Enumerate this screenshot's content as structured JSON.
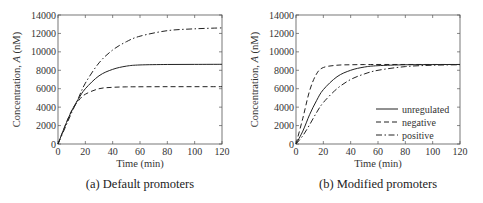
{
  "chart_data": [
    {
      "id": "a",
      "type": "line",
      "caption": "(a) Default promoters",
      "xlabel": "Time (min)",
      "ylabel": "Concentration, A (nM)",
      "xlim": [
        0,
        120
      ],
      "ylim": [
        0,
        14000
      ],
      "xticks": [
        0,
        20,
        40,
        60,
        80,
        100,
        120
      ],
      "yticks": [
        0,
        2000,
        4000,
        6000,
        8000,
        10000,
        12000,
        14000
      ],
      "grid": false,
      "legend": null,
      "x": [
        0,
        5,
        10,
        15,
        20,
        30,
        40,
        50,
        60,
        80,
        100,
        120
      ],
      "series": [
        {
          "name": "unregulated",
          "style": "solid",
          "values": [
            0,
            1900,
            3600,
            4900,
            6000,
            7400,
            8100,
            8450,
            8580,
            8630,
            8640,
            8650
          ]
        },
        {
          "name": "negative",
          "style": "dashed",
          "values": [
            0,
            1900,
            3600,
            4700,
            5400,
            6000,
            6150,
            6200,
            6210,
            6220,
            6220,
            6220
          ]
        },
        {
          "name": "positive",
          "style": "dashdot",
          "values": [
            0,
            1700,
            3400,
            5000,
            6600,
            8800,
            10200,
            11100,
            11700,
            12300,
            12500,
            12600
          ]
        }
      ]
    },
    {
      "id": "b",
      "type": "line",
      "caption": "(b) Modified promoters",
      "xlabel": "Time (min)",
      "ylabel": "Concentration, A (nM)",
      "xlim": [
        0,
        120
      ],
      "ylim": [
        0,
        14000
      ],
      "xticks": [
        0,
        20,
        40,
        60,
        80,
        100,
        120
      ],
      "yticks": [
        0,
        2000,
        4000,
        6000,
        8000,
        10000,
        12000,
        14000
      ],
      "grid": false,
      "legend": {
        "position": "lower right",
        "entries": [
          "unregulated",
          "negative",
          "positive"
        ]
      },
      "x": [
        0,
        5,
        10,
        15,
        20,
        30,
        40,
        50,
        60,
        80,
        100,
        120
      ],
      "series": [
        {
          "name": "unregulated",
          "style": "solid",
          "values": [
            0,
            1400,
            3200,
            4700,
            5900,
            7300,
            8000,
            8350,
            8500,
            8600,
            8620,
            8630
          ]
        },
        {
          "name": "negative",
          "style": "dashed",
          "values": [
            0,
            2800,
            5800,
            7600,
            8300,
            8550,
            8600,
            8620,
            8630,
            8630,
            8630,
            8630
          ]
        },
        {
          "name": "positive",
          "style": "dashdot",
          "values": [
            0,
            900,
            2100,
            3400,
            4500,
            6000,
            7000,
            7600,
            8000,
            8400,
            8550,
            8600
          ]
        }
      ]
    }
  ]
}
